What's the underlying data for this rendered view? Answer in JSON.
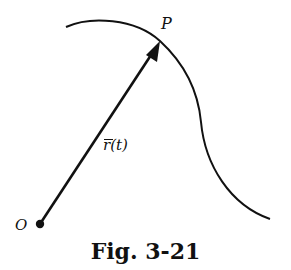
{
  "figure": {
    "caption": "Fig. 3-21",
    "labels": {
      "point_p": "P",
      "origin": "O",
      "position_vector": "r(t)"
    },
    "colors": {
      "stroke": "#111111",
      "background": "#ffffff"
    },
    "elements": {
      "curve": "space curve passing through P",
      "vector": "position vector from O to P",
      "origin_marker": "filled dot at O"
    }
  }
}
